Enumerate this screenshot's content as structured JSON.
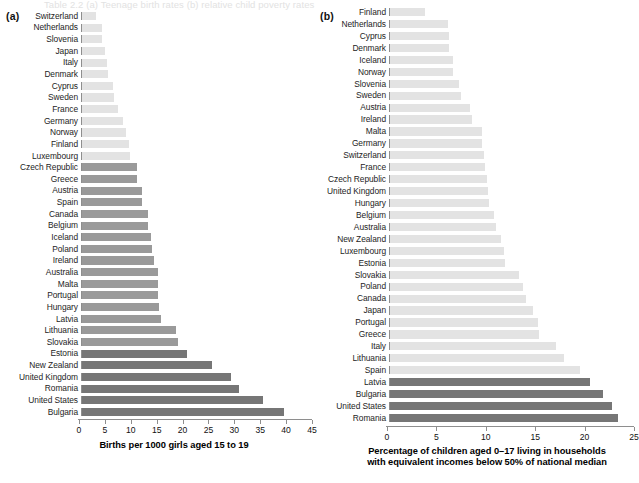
{
  "ghost_header_text": "Table 2.2  (a) Teenage birth rates  (b) relative child poverty rates",
  "panels": [
    {
      "tag": "(a)",
      "axis_title": "Births per 1000 girls aged 15 to 19",
      "ticks": [
        0,
        5,
        10,
        15,
        20,
        25,
        30,
        35,
        40,
        45
      ],
      "xmin": 0,
      "xmax": 45,
      "categories": [
        "Switzerland",
        "Netherlands",
        "Slovenia",
        "Japan",
        "Italy",
        "Denmark",
        "Cyprus",
        "Sweden",
        "France",
        "Germany",
        "Norway",
        "Finland",
        "Luxembourg",
        "Czech Republic",
        "Greece",
        "Austria",
        "Spain",
        "Canada",
        "Belgium",
        "Iceland",
        "Poland",
        "Ireland",
        "Australia",
        "Malta",
        "Portugal",
        "Hungary",
        "Latvia",
        "Lithuania",
        "Slovakia",
        "Estonia",
        "New Zealand",
        "United Kingdom",
        "Romania",
        "United States",
        "Bulgaria"
      ],
      "values": [
        2.9,
        4.0,
        4.0,
        4.6,
        5.0,
        5.1,
        6.1,
        6.3,
        7.2,
        8.1,
        8.6,
        9.3,
        9.4,
        10.8,
        10.9,
        11.8,
        11.9,
        13.0,
        13.0,
        13.5,
        13.7,
        14.2,
        14.9,
        14.9,
        15.0,
        15.2,
        15.6,
        18.5,
        18.8,
        20.5,
        25.5,
        29.1,
        30.8,
        35.5,
        39.5
      ],
      "shades": [
        "light",
        "light",
        "light",
        "light",
        "light",
        "light",
        "light",
        "light",
        "light",
        "light",
        "light",
        "light",
        "light",
        "mid",
        "mid",
        "mid",
        "mid",
        "mid",
        "mid",
        "mid",
        "mid",
        "mid",
        "mid",
        "mid",
        "mid",
        "mid",
        "mid",
        "mid",
        "mid",
        "dark",
        "dark",
        "dark",
        "dark",
        "dark",
        "dark"
      ]
    },
    {
      "tag": "(b)",
      "axis_title": "Percentage of children aged 0–17 living in households\nwith equivalent incomes below 50% of national median",
      "ticks": [
        0,
        5,
        10,
        15,
        20,
        25
      ],
      "xmin": 0,
      "xmax": 25,
      "categories": [
        "Finland",
        "Netherlands",
        "Cyprus",
        "Denmark",
        "Iceland",
        "Norway",
        "Slovenia",
        "Sweden",
        "Austria",
        "Ireland",
        "Malta",
        "Germany",
        "Switzerland",
        "France",
        "Czech Republic",
        "United Kingdom",
        "Hungary",
        "Belgium",
        "Australia",
        "New Zealand",
        "Luxembourg",
        "Estonia",
        "Slovakia",
        "Poland",
        "Canada",
        "Japan",
        "Portugal",
        "Greece",
        "Italy",
        "Lithuania",
        "Spain",
        "Latvia",
        "Bulgaria",
        "United States",
        "Romania"
      ],
      "values": [
        3.6,
        6.0,
        6.1,
        6.1,
        6.5,
        6.5,
        7.1,
        7.3,
        8.2,
        8.4,
        9.5,
        9.5,
        9.7,
        9.8,
        10.0,
        10.1,
        10.2,
        10.7,
        10.9,
        11.4,
        11.7,
        11.8,
        13.2,
        13.6,
        14.0,
        14.7,
        15.2,
        15.3,
        17.0,
        17.8,
        19.5,
        20.5,
        21.8,
        22.7,
        23.4
      ],
      "shades": [
        "light",
        "light",
        "light",
        "light",
        "light",
        "light",
        "light",
        "light",
        "light",
        "light",
        "light",
        "light",
        "light",
        "light",
        "light",
        "light",
        "light",
        "light",
        "light",
        "light",
        "light",
        "light",
        "light",
        "light",
        "light",
        "light",
        "light",
        "light",
        "light",
        "light",
        "light",
        "dark",
        "dark",
        "dark",
        "dark"
      ]
    }
  ],
  "colors": {
    "light": "#e3e3e3",
    "mid": "#9a9a9a",
    "dark": "#767676",
    "axis": "#8e8e8e",
    "text": "#1a1a1a"
  },
  "chart_data": [
    {
      "type": "bar",
      "orientation": "horizontal",
      "title": "(a)",
      "xlabel": "Births per 1000 girls aged 15 to 19",
      "ylabel": "",
      "xlim": [
        0,
        45
      ],
      "xticks": [
        0,
        5,
        10,
        15,
        20,
        25,
        30,
        35,
        40,
        45
      ],
      "grid": false,
      "legend": "none",
      "categories": [
        "Switzerland",
        "Netherlands",
        "Slovenia",
        "Japan",
        "Italy",
        "Denmark",
        "Cyprus",
        "Sweden",
        "France",
        "Germany",
        "Norway",
        "Finland",
        "Luxembourg",
        "Czech Republic",
        "Greece",
        "Austria",
        "Spain",
        "Canada",
        "Belgium",
        "Iceland",
        "Poland",
        "Ireland",
        "Australia",
        "Malta",
        "Portugal",
        "Hungary",
        "Latvia",
        "Lithuania",
        "Slovakia",
        "Estonia",
        "New Zealand",
        "United Kingdom",
        "Romania",
        "United States",
        "Bulgaria"
      ],
      "values": [
        2.9,
        4.0,
        4.0,
        4.6,
        5.0,
        5.1,
        6.1,
        6.3,
        7.2,
        8.1,
        8.6,
        9.3,
        9.4,
        10.8,
        10.9,
        11.8,
        11.9,
        13.0,
        13.0,
        13.5,
        13.7,
        14.2,
        14.9,
        14.9,
        15.0,
        15.2,
        15.6,
        18.5,
        18.8,
        20.5,
        25.5,
        29.1,
        30.8,
        35.5,
        39.5
      ]
    },
    {
      "type": "bar",
      "orientation": "horizontal",
      "title": "(b)",
      "xlabel": "Percentage of children aged 0–17 living in households with equivalent incomes below 50% of national median",
      "ylabel": "",
      "xlim": [
        0,
        25
      ],
      "xticks": [
        0,
        5,
        10,
        15,
        20,
        25
      ],
      "grid": false,
      "legend": "none",
      "categories": [
        "Finland",
        "Netherlands",
        "Cyprus",
        "Denmark",
        "Iceland",
        "Norway",
        "Slovenia",
        "Sweden",
        "Austria",
        "Ireland",
        "Malta",
        "Germany",
        "Switzerland",
        "France",
        "Czech Republic",
        "United Kingdom",
        "Hungary",
        "Belgium",
        "Australia",
        "New Zealand",
        "Luxembourg",
        "Estonia",
        "Slovakia",
        "Poland",
        "Canada",
        "Japan",
        "Portugal",
        "Greece",
        "Italy",
        "Lithuania",
        "Spain",
        "Latvia",
        "Bulgaria",
        "United States",
        "Romania"
      ],
      "values": [
        3.6,
        6.0,
        6.1,
        6.1,
        6.5,
        6.5,
        7.1,
        7.3,
        8.2,
        8.4,
        9.5,
        9.5,
        9.7,
        9.8,
        10.0,
        10.1,
        10.2,
        10.7,
        10.9,
        11.4,
        11.7,
        11.8,
        13.2,
        13.6,
        14.0,
        14.7,
        15.2,
        15.3,
        17.0,
        17.8,
        19.5,
        20.5,
        21.8,
        22.7,
        23.4
      ]
    }
  ]
}
